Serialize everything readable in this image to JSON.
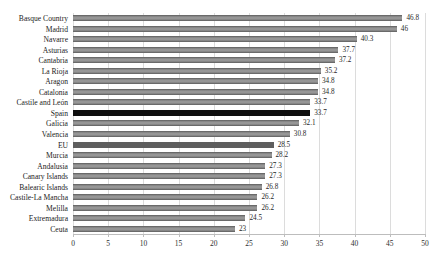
{
  "chart_data": {
    "type": "bar",
    "orientation": "horizontal",
    "title": "",
    "xlabel": "",
    "ylabel": "",
    "categories": [
      "Basque Country",
      "Madrid",
      "Navarre",
      "Asturias",
      "Cantabria",
      "La Rioja",
      "Aragon",
      "Catalonia",
      "Castile and León",
      "Spain",
      "Galicia",
      "Valencia",
      "EU",
      "Murcia",
      "Andalusia",
      "Canary Islands",
      "Balearic Islands",
      "Castile-La Mancha",
      "Melilla",
      "Extremadura",
      "Ceuta"
    ],
    "values": [
      46.8,
      46,
      40.3,
      37.7,
      37.2,
      35.2,
      34.8,
      34.8,
      33.7,
      33.7,
      32.1,
      30.8,
      28.5,
      28.2,
      27.3,
      27.3,
      26.8,
      26.2,
      26.2,
      24.5,
      23
    ],
    "value_labels": [
      "46.8",
      "46",
      "40.3",
      "37.7",
      "37.2",
      "35.2",
      "34.8",
      "34.8",
      "33.7",
      "33.7",
      "32.1",
      "30.8",
      "28.5",
      "28.2",
      "27.3",
      "27.3",
      "26.8",
      "26.2",
      "26.2",
      "24.5",
      "23"
    ],
    "xlim": [
      0,
      50
    ],
    "xticks": [
      0,
      5,
      10,
      15,
      20,
      25,
      30,
      35,
      40,
      45,
      50
    ],
    "xtick_labels": [
      "0",
      "5",
      "10",
      "15",
      "20",
      "25",
      "30",
      "35",
      "40",
      "45",
      "50"
    ],
    "grid": "vertical",
    "legend": "none",
    "colors": {
      "default": "#7c7c7c",
      "highlights": {
        "Spain": "#0f0f0f",
        "EU": "#5e5e5e"
      }
    },
    "gridline_color": "#dcdcdc",
    "axis_line_color": "#bdbdbd",
    "background": "#ffffff"
  }
}
